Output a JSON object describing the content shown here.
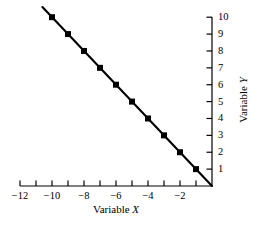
{
  "chart_data": {
    "type": "line",
    "title": "",
    "subtitle": "",
    "xlabel_prefix": "Variable",
    "xlabel_symbol": "X",
    "ylabel_prefix": "Variable",
    "ylabel_symbol": "Y",
    "xlabel": "Variable X",
    "ylabel": "Variable Y",
    "xlim": [
      -12,
      0
    ],
    "ylim": [
      0,
      10
    ],
    "grid": false,
    "legend": "none",
    "x_axis_position": "bottom",
    "y_axis_position": "right",
    "x_tick_values": [
      -12,
      -11,
      -10,
      -9,
      -8,
      -7,
      -6,
      -5,
      -4,
      -3,
      -2,
      -1
    ],
    "x_tick_labels": [
      "-12",
      "",
      "-10",
      "",
      "-8",
      "",
      "-6",
      "",
      "-4",
      "",
      "-2",
      ""
    ],
    "y_tick_values": [
      1,
      2,
      3,
      4,
      5,
      6,
      7,
      8,
      9,
      10
    ],
    "y_tick_labels": [
      "1",
      "2",
      "3",
      "4",
      "5",
      "6",
      "7",
      "8",
      "9",
      "10"
    ],
    "series": [
      {
        "name": "",
        "marker": "square",
        "marker_color": "#000000",
        "line_color": "#000000",
        "points": [
          {
            "x": -10,
            "y": 10
          },
          {
            "x": -9,
            "y": 9
          },
          {
            "x": -8,
            "y": 8
          },
          {
            "x": -7,
            "y": 7
          },
          {
            "x": -6,
            "y": 6
          },
          {
            "x": -5,
            "y": 5
          },
          {
            "x": -4,
            "y": 4
          },
          {
            "x": -3,
            "y": 3
          },
          {
            "x": -2,
            "y": 2
          },
          {
            "x": -1,
            "y": 1
          }
        ],
        "line_extent": [
          {
            "x": -10.6,
            "y": 10.6
          },
          {
            "x": 0,
            "y": 0
          }
        ]
      }
    ]
  },
  "colors": {
    "background": "#ffffff",
    "axis": "#000000",
    "data": "#000000"
  }
}
